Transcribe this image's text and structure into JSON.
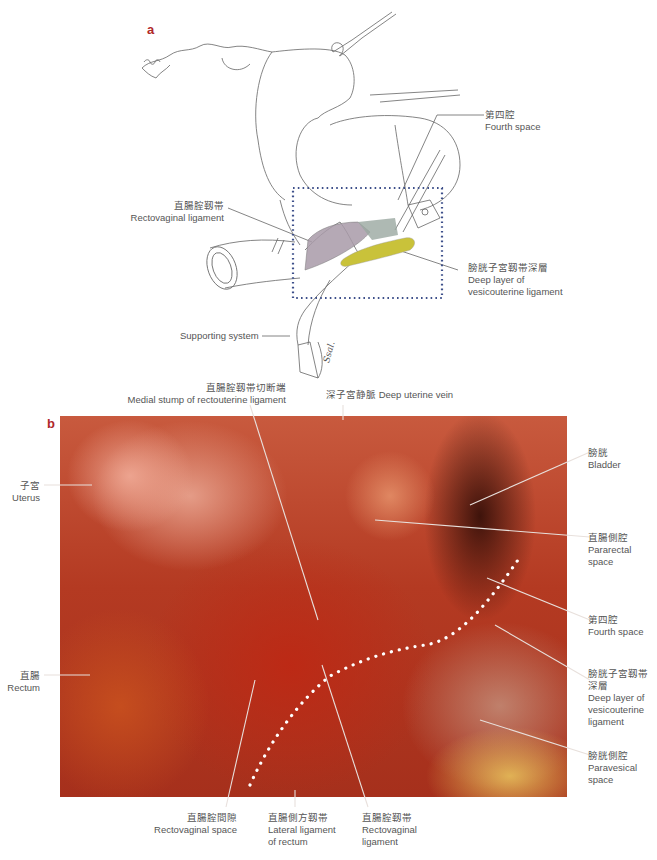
{
  "panel_a": {
    "letter": "a",
    "labels": {
      "fourth_space": {
        "zh": "第四腔",
        "en": "Fourth space"
      },
      "rectovaginal_ligament": {
        "zh": "直腸腟靱帯",
        "en": "Rectovaginal ligament"
      },
      "deep_layer": {
        "zh": "膀胱子宮靱帯深層",
        "en1": "Deep layer of",
        "en2": "vesicouterine ligament"
      },
      "supporting_system": {
        "en": "Supporting system"
      }
    },
    "signature": "Ssal.",
    "colors": {
      "rectovaginal_hatch": "#a89aa8",
      "deep_layer_fill": "#c9c23a",
      "dotted_box": "#3d4f8a",
      "gray_region": "#9aa8a0"
    }
  },
  "panel_b": {
    "letter": "b",
    "labels": {
      "medial_stump": {
        "zh": "直腸腟靱帯切断端",
        "en": "Medial stump of rectouterine ligament"
      },
      "deep_uterine_vein": {
        "text": "深子宮静脈 Deep uterine vein"
      },
      "uterus": {
        "zh": "子宮",
        "en": "Uterus"
      },
      "rectum": {
        "zh": "直腸",
        "en": "Rectum"
      },
      "bladder": {
        "zh": "膀胱",
        "en": "Bladder"
      },
      "pararectal_space": {
        "zh": "直腸側腔",
        "en1": "Pararectal",
        "en2": "space"
      },
      "fourth_space": {
        "zh": "第四腔",
        "en": "Fourth space"
      },
      "deep_layer": {
        "zh1": "膀胱子宮靱帯",
        "zh2": "深層",
        "en1": "Deep layer of",
        "en2": "vesicouterine",
        "en3": "ligament"
      },
      "paravesical_space": {
        "zh": "膀胱側腔",
        "en1": "Paravesical",
        "en2": "space"
      },
      "rectovaginal_space": {
        "zh": "直腸腟間隙",
        "en": "Rectovaginal space"
      },
      "lateral_ligament": {
        "zh": "直腸側方靱帯",
        "en1": "Lateral ligament",
        "en2": "of rectum"
      },
      "rectovaginal_ligament": {
        "zh": "直腸腟靱帯",
        "en1": "Rectovaginal",
        "en2": "ligament"
      }
    },
    "colors": {
      "photo_base": "#b43a22",
      "dotted_line": "#ffffff"
    }
  }
}
